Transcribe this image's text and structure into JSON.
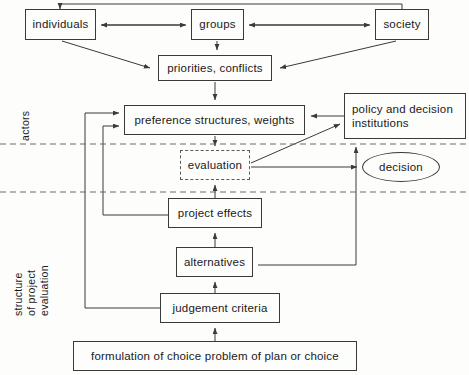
{
  "diagram": {
    "bands": [
      {
        "id": "actors",
        "label": "actors"
      },
      {
        "id": "structure",
        "label": "structure\nof project\nevaluation"
      }
    ],
    "nodes": [
      {
        "id": "individuals",
        "label": "individuals",
        "shape": "rect",
        "x": 25,
        "y": 9,
        "w": 71,
        "h": 31
      },
      {
        "id": "groups",
        "label": "groups",
        "shape": "rect",
        "x": 191,
        "y": 9,
        "w": 53,
        "h": 31
      },
      {
        "id": "society",
        "label": "society",
        "shape": "rect",
        "x": 375,
        "y": 9,
        "w": 54,
        "h": 31
      },
      {
        "id": "priorities",
        "label": "priorities, conflicts",
        "shape": "rect",
        "x": 158,
        "y": 55,
        "w": 114,
        "h": 26
      },
      {
        "id": "preference",
        "label": "preference structures, weights",
        "shape": "rect",
        "x": 124,
        "y": 105,
        "w": 181,
        "h": 30
      },
      {
        "id": "policy",
        "label": "policy and decision\ninstitutions",
        "shape": "rect",
        "x": 344,
        "y": 93,
        "w": 122,
        "h": 46
      },
      {
        "id": "evaluation",
        "label": "evaluation",
        "shape": "dashed",
        "x": 180,
        "y": 150,
        "w": 70,
        "h": 30
      },
      {
        "id": "decision",
        "label": "decision",
        "shape": "ellipse",
        "x": 362,
        "y": 152,
        "w": 78,
        "h": 30
      },
      {
        "id": "effects",
        "label": "project effects",
        "shape": "rect",
        "x": 168,
        "y": 198,
        "w": 94,
        "h": 30
      },
      {
        "id": "alternatives",
        "label": "alternatives",
        "shape": "rect",
        "x": 176,
        "y": 247,
        "w": 77,
        "h": 30
      },
      {
        "id": "criteria",
        "label": "judgement criteria",
        "shape": "rect",
        "x": 160,
        "y": 293,
        "w": 120,
        "h": 30
      },
      {
        "id": "formulation",
        "label": "formulation of choice problem of plan or choice",
        "shape": "rect",
        "x": 73,
        "y": 341,
        "w": 284,
        "h": 30
      }
    ],
    "edges": [
      {
        "from": "society",
        "to": "groups",
        "kind": "arrow-left"
      },
      {
        "from": "groups",
        "to": "individuals",
        "kind": "arrow-both"
      },
      {
        "from": "individuals",
        "to": "priorities",
        "kind": "diagonal"
      },
      {
        "from": "society",
        "to": "priorities",
        "kind": "diagonal"
      },
      {
        "from": "groups",
        "to": "priorities",
        "kind": "arrow-down"
      },
      {
        "from": "priorities",
        "to": "preference",
        "kind": "arrow-down"
      },
      {
        "from": "policy",
        "to": "preference",
        "kind": "arrow-left"
      },
      {
        "from": "preference",
        "to": "evaluation",
        "kind": "arrow-down"
      },
      {
        "from": "evaluation",
        "to": "policy",
        "kind": "diagonal"
      },
      {
        "from": "evaluation",
        "to": "decision",
        "kind": "arrow-right"
      },
      {
        "from": "effects",
        "to": "evaluation",
        "kind": "arrow-up"
      },
      {
        "from": "alternatives",
        "to": "effects",
        "kind": "arrow-up"
      },
      {
        "from": "criteria",
        "to": "alternatives",
        "kind": "arrow-up"
      },
      {
        "from": "formulation",
        "to": "criteria",
        "kind": "arrow-up"
      },
      {
        "from": "criteria",
        "to": "preference",
        "kind": "feedback-outer"
      },
      {
        "from": "effects",
        "to": "preference",
        "kind": "feedback-inner"
      },
      {
        "from": "alternatives",
        "to": "decision",
        "kind": "feedback-right"
      },
      {
        "from": "society",
        "to": "individuals",
        "kind": "top-loop"
      }
    ],
    "separators": [
      {
        "id": "sep-actors-bottom",
        "y": 144
      },
      {
        "id": "sep-structure-top",
        "y": 192
      }
    ],
    "colors": {
      "stroke": "#3a3a3a",
      "dashed": "#5a5a5a",
      "text": "#1a1a1a",
      "background": "#fdfdfc"
    }
  }
}
